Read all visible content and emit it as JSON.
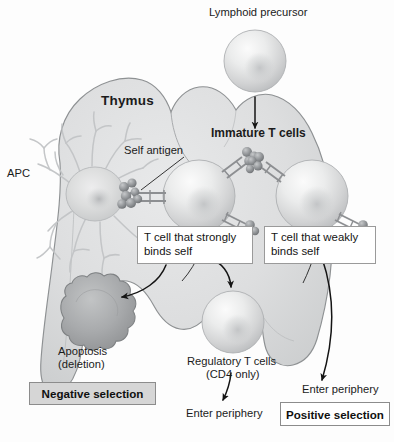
{
  "figure": {
    "organ_label": "Thymus",
    "background_color": "#fdfdfd",
    "organ_fill": "#d9dadb",
    "organ_stroke": "#8e9193"
  },
  "labels": {
    "lymphoid_precursor": "Lymphoid precursor",
    "thymus": "Thymus",
    "immature_t_cells": "Immature T cells",
    "apc": "APC",
    "self_antigen": "Self antigen",
    "apoptosis_line1": "Apoptosis",
    "apoptosis_line2": "(deletion)",
    "regulatory_line1": "Regulatory T cells",
    "regulatory_line2": "(CD4 only)",
    "enter_periphery_left": "Enter periphery",
    "enter_periphery_right": "Enter periphery"
  },
  "callouts": [
    {
      "name": "strong-binder-callout",
      "text": "T cell that strongly\nbinds self"
    },
    {
      "name": "weak-binder-callout",
      "text": "T cell that weakly\nbinds self"
    }
  ],
  "selection_boxes": [
    {
      "name": "negative-selection-box",
      "label": "Negative selection",
      "style": "shaded",
      "fill": "#d6d6d6"
    },
    {
      "name": "positive-selection-box",
      "label": "Positive selection",
      "style": "plain",
      "fill": "#ffffff"
    }
  ],
  "cells": [
    {
      "name": "lymphoid-precursor-cell",
      "type": "sphere",
      "fill": "#dcdddd"
    },
    {
      "name": "immature-t-cell-strong",
      "type": "sphere",
      "fill": "#e2e3e3"
    },
    {
      "name": "immature-t-cell-weak",
      "type": "sphere",
      "fill": "#e2e3e3"
    },
    {
      "name": "apc-dendritic-cell",
      "type": "dendritic",
      "fill": "#d2d3d4"
    },
    {
      "name": "apoptotic-cell",
      "type": "blebbed-blob",
      "fill": "#a9abac"
    },
    {
      "name": "regulatory-t-cell",
      "type": "sphere",
      "fill": "#d8d9da"
    }
  ],
  "receptors": {
    "name": "t-cell-receptor-complex",
    "count": 4,
    "fill": "#8d8f92"
  },
  "arrows": [
    {
      "name": "arrow-precursor-to-thymus",
      "style": "straight-down"
    },
    {
      "name": "arrow-strong-to-apoptosis",
      "style": "curved-left"
    },
    {
      "name": "arrow-strong-to-regulatory",
      "style": "curved-right-down"
    },
    {
      "name": "arrow-regulatory-to-periphery",
      "style": "short-down"
    },
    {
      "name": "arrow-weak-to-periphery",
      "style": "long-curved-down"
    }
  ],
  "leader_lines": [
    {
      "name": "leader-self-antigen"
    },
    {
      "name": "leader-strong-callout-to-cell"
    },
    {
      "name": "leader-weak-callout-to-cell"
    }
  ]
}
